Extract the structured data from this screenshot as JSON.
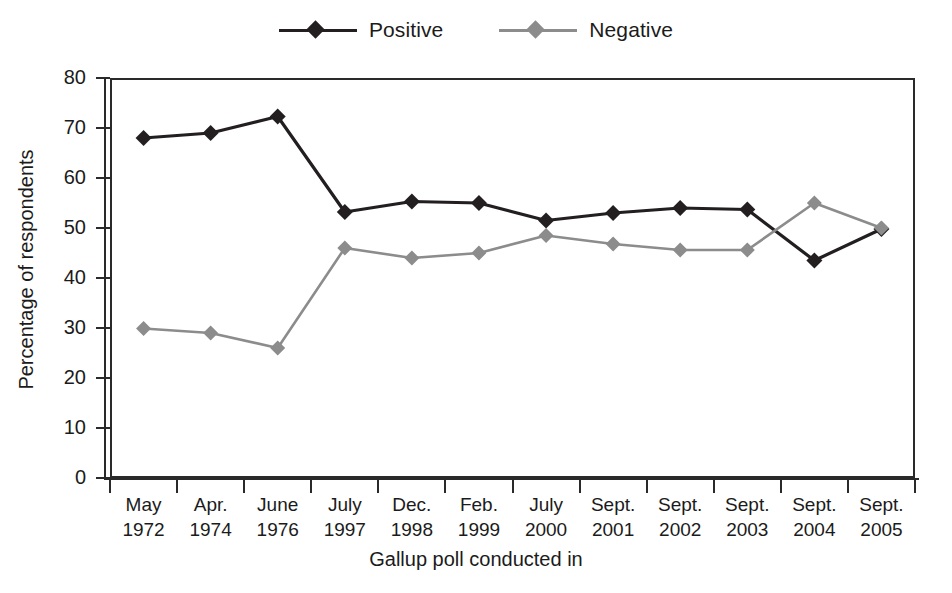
{
  "chart_data": {
    "type": "line",
    "title": "",
    "xlabel": "Gallup poll conducted in",
    "ylabel": "Percentage of respondents",
    "ylim": [
      0,
      80
    ],
    "ytick_values": [
      0,
      10,
      20,
      30,
      40,
      50,
      60,
      70,
      80
    ],
    "ytick_labels": [
      "0",
      "10",
      "20",
      "30",
      "40",
      "50",
      "60",
      "70",
      "80"
    ],
    "grid": false,
    "legend_position": "top-center",
    "categories": [
      "May 1972",
      "Apr. 1974",
      "June 1976",
      "July 1997",
      "Dec. 1998",
      "Feb. 1999",
      "July 2000",
      "Sept. 2001",
      "Sept. 2002",
      "Sept. 2003",
      "Sept. 2004",
      "Sept. 2005"
    ],
    "category_lines": [
      [
        "May",
        "1972"
      ],
      [
        "Apr.",
        "1974"
      ],
      [
        "June",
        "1976"
      ],
      [
        "July",
        "1997"
      ],
      [
        "Dec.",
        "1998"
      ],
      [
        "Feb.",
        "1999"
      ],
      [
        "July",
        "2000"
      ],
      [
        "Sept.",
        "2001"
      ],
      [
        "Sept.",
        "2002"
      ],
      [
        "Sept.",
        "2003"
      ],
      [
        "Sept.",
        "2004"
      ],
      [
        "Sept.",
        "2005"
      ]
    ],
    "series": [
      {
        "name": "Positive",
        "color": "#231f20",
        "marker": "diamond",
        "values": [
          68,
          69,
          72.3,
          53.2,
          55.3,
          55,
          51.5,
          53,
          54,
          53.7,
          43.5,
          49.8
        ]
      },
      {
        "name": "Negative",
        "color": "#8c8c8c",
        "marker": "diamond",
        "values": [
          29.9,
          29,
          26,
          46,
          44,
          45,
          48.5,
          46.8,
          45.6,
          45.6,
          55,
          50
        ]
      }
    ]
  },
  "legend": {
    "entries": [
      {
        "label": "Positive",
        "color": "#231f20"
      },
      {
        "label": "Negative",
        "color": "#8c8c8c"
      }
    ]
  },
  "axis": {
    "y_title": "Percentage of respondents",
    "x_title": "Gallup poll conducted in"
  }
}
